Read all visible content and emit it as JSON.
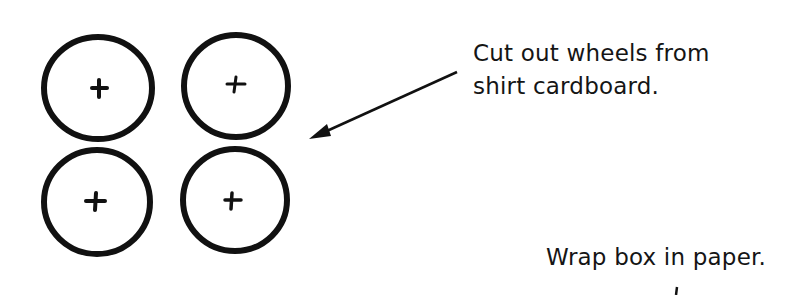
{
  "diagram": {
    "wheels": [
      {
        "id": "wheel-top-left",
        "cx": 98,
        "cy": 88,
        "r": 53
      },
      {
        "id": "wheel-top-right",
        "cx": 236,
        "cy": 86,
        "r": 53
      },
      {
        "id": "wheel-bottom-left",
        "cx": 96,
        "cy": 202,
        "r": 53
      },
      {
        "id": "wheel-bottom-right",
        "cx": 234,
        "cy": 200,
        "r": 53
      }
    ],
    "annotations": [
      {
        "id": "cut-out-wheels",
        "lines": [
          "Cut out wheels from",
          "shirt cardboard."
        ]
      },
      {
        "id": "wrap-box",
        "lines": [
          "Wrap box in paper."
        ]
      }
    ],
    "arrow": {
      "from": [
        457,
        72
      ],
      "to": [
        309,
        139
      ]
    },
    "colors": {
      "ink": "#111111",
      "background": "#ffffff"
    }
  }
}
